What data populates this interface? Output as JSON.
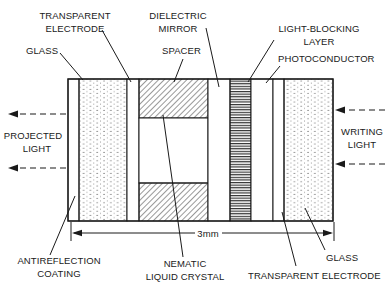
{
  "diagram": {
    "labels": {
      "transparent_electrode_top_line1": "TRANSPARENT",
      "transparent_electrode_top_line2": "ELECTRODE",
      "dielectric_mirror_line1": "DIELECTRIC",
      "dielectric_mirror_line2": "MIRROR",
      "glass_left": "GLASS",
      "spacer": "SPACER",
      "light_blocking_line1": "LIGHT-BLOCKING",
      "light_blocking_line2": "LAYER",
      "photoconductor": "PHOTOCONDUCTOR",
      "projected_light_line1": "PROJECTED",
      "projected_light_line2": "LIGHT",
      "writing_light_line1": "WRITING",
      "writing_light_line2": "LIGHT",
      "antireflection_line1": "ANTIREFLECTION",
      "antireflection_line2": "COATING",
      "nematic_line1": "NEMATIC",
      "nematic_line2": "LIQUID CRYSTAL",
      "glass_right": "GLASS",
      "transparent_electrode_bottom": "TRANSPARENT ELECTRODE",
      "dimension": "3mm"
    },
    "layers": [
      {
        "name": "antireflection-coating",
        "pattern": "plain"
      },
      {
        "name": "glass",
        "pattern": "dotted"
      },
      {
        "name": "transparent-electrode",
        "pattern": "plain"
      },
      {
        "name": "spacer-and-nematic-liquid-crystal",
        "pattern": "diagonal-hatch"
      },
      {
        "name": "dielectric-mirror",
        "pattern": "plain"
      },
      {
        "name": "light-blocking-layer",
        "pattern": "horizontal-lines"
      },
      {
        "name": "photoconductor",
        "pattern": "plain"
      },
      {
        "name": "transparent-electrode",
        "pattern": "plain"
      },
      {
        "name": "glass",
        "pattern": "dotted"
      }
    ],
    "colors": {
      "ink": "#1a1a1a",
      "background": "#ffffff"
    }
  }
}
